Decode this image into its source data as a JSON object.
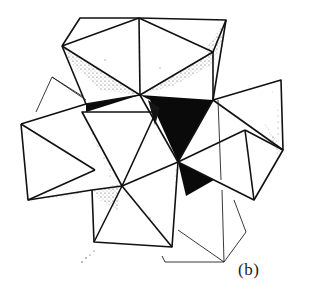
{
  "figure": {
    "label": "(b)",
    "colors": {
      "line": "#111111",
      "shade": "#0a0a0a",
      "stipple": "#333333",
      "background": "#ffffff"
    }
  }
}
